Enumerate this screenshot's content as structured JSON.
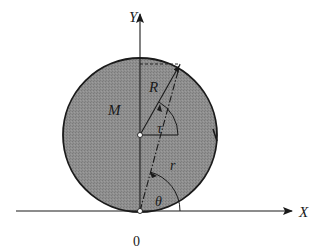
{
  "diagram": {
    "colors": {
      "disk_fill": "#8a8a8a",
      "disk_edge": "#1a1a1a",
      "line": "#1a1a1a",
      "background": "#ffffff"
    },
    "labels": {
      "y_axis": "Y",
      "x_axis": "X",
      "origin": "0",
      "mass": "M",
      "radius": "R",
      "tau": "τ",
      "r": "r",
      "theta": "θ"
    },
    "geometry": {
      "center": [
        140,
        135
      ],
      "radius_px": 77,
      "contact_point": [
        140,
        211
      ],
      "point_on_rim": [
        180,
        64
      ]
    }
  }
}
